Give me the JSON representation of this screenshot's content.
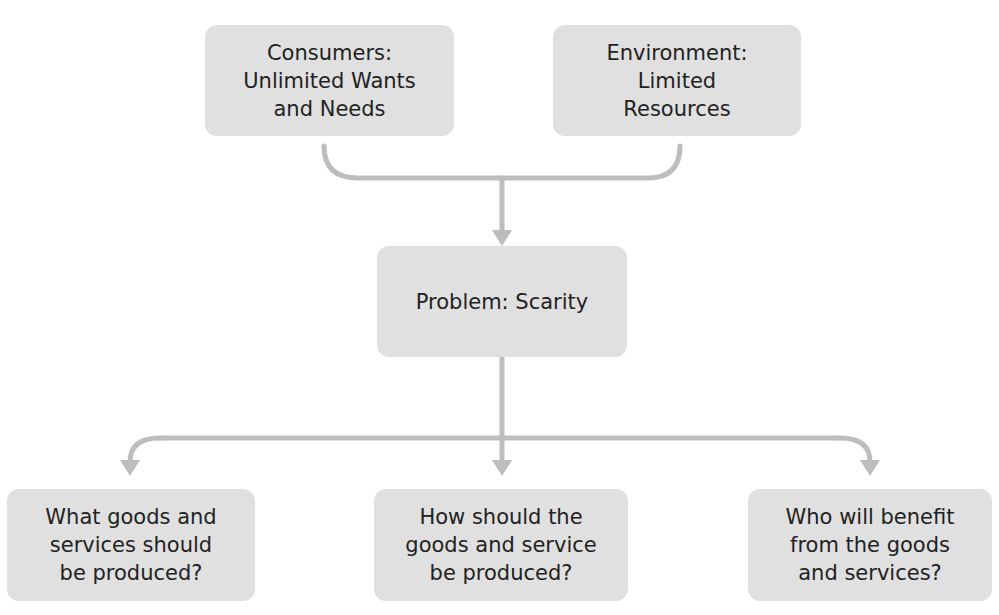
{
  "diagram": {
    "type": "flowchart",
    "colors": {
      "node_fill": "#e0e0e0",
      "connector": "#bdbdbd",
      "text": "#222222",
      "background": "#ffffff"
    },
    "top_nodes": [
      {
        "id": "consumers",
        "label": "Consumers:\nUnlimited Wants\nand Needs"
      },
      {
        "id": "environment",
        "label": "Environment:\nLimited\nResources"
      }
    ],
    "center_node": {
      "id": "problem",
      "label": "Problem: Scarity"
    },
    "bottom_nodes": [
      {
        "id": "what",
        "label": "What goods and\nservices should\nbe produced?"
      },
      {
        "id": "how",
        "label": "How should the\ngoods and service\nbe produced?"
      },
      {
        "id": "who",
        "label": "Who will benefit\nfrom the goods\nand services?"
      }
    ],
    "edges": [
      {
        "from": [
          "consumers",
          "environment"
        ],
        "to": "problem",
        "style": "merge-bracket-arrow"
      },
      {
        "from": "problem",
        "to": "what",
        "style": "branch-arrow"
      },
      {
        "from": "problem",
        "to": "how",
        "style": "branch-arrow"
      },
      {
        "from": "problem",
        "to": "who",
        "style": "branch-arrow"
      }
    ]
  }
}
